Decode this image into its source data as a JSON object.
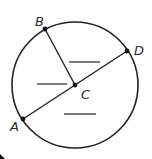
{
  "diagram": {
    "type": "circle-geometry",
    "colors": {
      "stroke": "#222222",
      "background": "#ffffff"
    },
    "circle": {
      "center": "C",
      "cx": 75,
      "cy": 85,
      "r": 63
    },
    "points": [
      {
        "id": "A",
        "label": "A",
        "x": 23,
        "y": 119,
        "label_x": 10,
        "label_y": 131
      },
      {
        "id": "B",
        "label": "B",
        "x": 45,
        "y": 29,
        "label_x": 35,
        "label_y": 26
      },
      {
        "id": "C",
        "label": "C",
        "x": 75,
        "y": 85,
        "label_x": 81,
        "label_y": 99
      },
      {
        "id": "D",
        "label": "D",
        "x": 127,
        "y": 51,
        "label_x": 134,
        "label_y": 55
      }
    ],
    "segments": [
      {
        "id": "diameter-AD",
        "from": "A",
        "to": "D"
      },
      {
        "id": "radius-CB",
        "from": "C",
        "to": "B"
      }
    ],
    "answer_blanks": [
      {
        "id": "blank-upper",
        "x1": 69,
        "y1": 62,
        "x2": 100,
        "y2": 62
      },
      {
        "id": "blank-left",
        "x1": 37,
        "y1": 84,
        "x2": 67,
        "y2": 84
      },
      {
        "id": "blank-lower",
        "x1": 64,
        "y1": 114,
        "x2": 96,
        "y2": 114
      }
    ]
  }
}
